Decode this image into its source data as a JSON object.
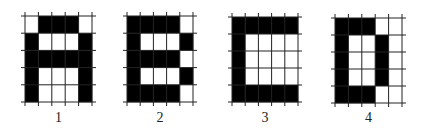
{
  "figure": {
    "grid_rows": 5,
    "grid_cols": 5,
    "fill_color": "#000000",
    "empty_color": "#ffffff",
    "line_color": "#222222",
    "panels": [
      {
        "label": "1",
        "letter": "A",
        "x": 25,
        "y": 16,
        "w": 67,
        "h": 86,
        "cells": [
          [
            0,
            1,
            1,
            1,
            0
          ],
          [
            1,
            0,
            0,
            0,
            1
          ],
          [
            1,
            1,
            1,
            1,
            1
          ],
          [
            1,
            0,
            0,
            0,
            1
          ],
          [
            1,
            0,
            0,
            0,
            1
          ]
        ]
      },
      {
        "label": "2",
        "letter": "B",
        "x": 127,
        "y": 16,
        "w": 66,
        "h": 86,
        "cells": [
          [
            1,
            1,
            1,
            1,
            0
          ],
          [
            1,
            0,
            0,
            0,
            1
          ],
          [
            1,
            1,
            1,
            1,
            0
          ],
          [
            1,
            0,
            0,
            0,
            1
          ],
          [
            1,
            1,
            1,
            1,
            0
          ]
        ]
      },
      {
        "label": "3",
        "letter": "C",
        "x": 232,
        "y": 17,
        "w": 66,
        "h": 85,
        "cells": [
          [
            1,
            1,
            1,
            1,
            1
          ],
          [
            1,
            0,
            0,
            0,
            0
          ],
          [
            1,
            0,
            0,
            0,
            0
          ],
          [
            1,
            0,
            0,
            0,
            0
          ],
          [
            1,
            1,
            1,
            1,
            1
          ]
        ]
      },
      {
        "label": "4",
        "letter": "D",
        "x": 335,
        "y": 18,
        "w": 67,
        "h": 85,
        "cells": [
          [
            1,
            1,
            1,
            0,
            0
          ],
          [
            1,
            0,
            0,
            1,
            0
          ],
          [
            1,
            0,
            0,
            1,
            0
          ],
          [
            1,
            0,
            0,
            1,
            0
          ],
          [
            1,
            1,
            1,
            0,
            0
          ]
        ]
      }
    ]
  }
}
